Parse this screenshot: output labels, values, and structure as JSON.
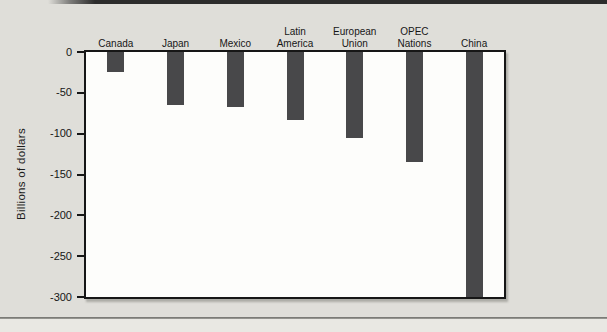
{
  "figure": {
    "background_color": "#dfded9",
    "plot_background_color": "#fdfdfb",
    "axis_color": "#161616",
    "text_color": "#1c1c1c",
    "top_rule_color": "#2c2c2c",
    "bottom_rule_color": "#6f6f6b"
  },
  "chart_data": {
    "type": "bar",
    "orientation": "vertical",
    "baseline": "top",
    "title": "",
    "xlabel": "",
    "ylabel": "Billions of dollars",
    "categories": [
      "Canada",
      "Japan",
      "Mexico",
      "Latin America",
      "European Union",
      "OPEC Nations",
      "China"
    ],
    "category_lines": [
      [
        "Canada"
      ],
      [
        "Japan"
      ],
      [
        "Mexico"
      ],
      [
        "Latin",
        "America"
      ],
      [
        "European",
        "Union"
      ],
      [
        "OPEC",
        "Nations"
      ],
      [
        "China"
      ]
    ],
    "values": [
      -25,
      -65,
      -67,
      -83,
      -105,
      -135,
      -300
    ],
    "ylim": [
      -300,
      0
    ],
    "yticks": [
      0,
      -50,
      -100,
      -150,
      -200,
      -250,
      -300
    ],
    "ytick_labels": [
      "0",
      "-50",
      "-100",
      "-150",
      "-200",
      "-250",
      "-300"
    ],
    "bar_color": "#48484a",
    "grid": false,
    "legend": "none"
  }
}
